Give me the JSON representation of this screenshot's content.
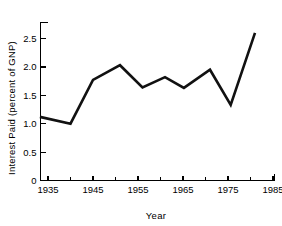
{
  "chart_data": {
    "type": "line",
    "title": "",
    "xlabel": "Year",
    "ylabel": "Interest Paid (percent of GNP)",
    "xlim": [
      1933.2,
      1985
    ],
    "ylim": [
      0,
      2.75
    ],
    "grid": false,
    "legend": null,
    "x_ticks": [
      1935,
      1945,
      1955,
      1965,
      1975,
      1985
    ],
    "x_tick_labels": [
      "1935",
      "1945",
      "1955",
      "1965",
      "1975",
      "1985"
    ],
    "x_minor_ticks": [
      1940,
      1950,
      1960,
      1970,
      1980
    ],
    "y_ticks": [
      0,
      0.5,
      1.0,
      1.5,
      2.0,
      2.5
    ],
    "y_tick_labels": [
      "0",
      "0.5",
      "1.0",
      "1.5",
      "2.0",
      "2.5"
    ],
    "series": [
      {
        "name": "Interest Paid (percent of GNP)",
        "color": "#111111",
        "x": [
          1933.2,
          1940.0,
          1945.0,
          1951.0,
          1956.0,
          1961.0,
          1965.2,
          1971.0,
          1975.6,
          1981.0
        ],
        "values": [
          1.12,
          1.0,
          1.77,
          2.03,
          1.64,
          1.82,
          1.63,
          1.95,
          1.33,
          2.6
        ]
      }
    ]
  },
  "axis": {
    "y_label": "Interest Paid (percent of GNP)",
    "x_label": "Year"
  }
}
